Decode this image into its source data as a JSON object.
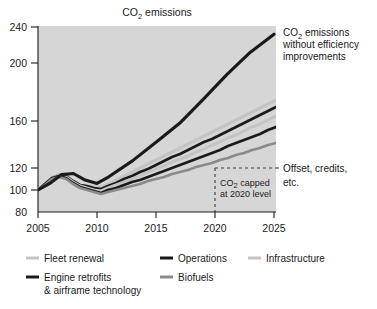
{
  "chart_data": {
    "type": "area",
    "title": "CO2 emissions",
    "title_display": "CO₂ emissions",
    "xlabel": "",
    "ylabel": "",
    "x": [
      2005,
      2010,
      2015,
      2020,
      2025
    ],
    "xlim": [
      2005,
      2025
    ],
    "ylim": [
      80,
      240
    ],
    "ytick_labels": [
      "240",
      "200",
      "160",
      "120",
      "100",
      "80"
    ],
    "ytick_values": [
      240,
      200,
      160,
      120,
      100,
      80
    ],
    "xtick_labels": [
      "2005",
      "2010",
      "2015",
      "2020",
      "2025"
    ],
    "grid": false,
    "legend_position": "bottom",
    "baseline_series": {
      "name": "CO2 emissions without efficiency improvements",
      "color": "#1a1a1a",
      "x": [
        2005,
        2006,
        2007,
        2008,
        2009,
        2010,
        2011,
        2013,
        2015,
        2017,
        2019,
        2021,
        2023,
        2025
      ],
      "values": [
        100,
        106,
        114,
        115,
        109,
        106,
        112,
        126,
        142,
        158,
        175,
        192,
        212,
        232
      ]
    },
    "series": [
      {
        "name": "Fleet renewal",
        "color": "#c4c4c4",
        "values_2025": 157
      },
      {
        "name": "Operations",
        "color": "#1a1a1a",
        "values_2025": 152
      },
      {
        "name": "Infrastructure",
        "color": "#c4c4c4",
        "values_2025": 147
      },
      {
        "name": "Engine retrofits & airframe technology",
        "color": "#1a1a1a",
        "values_2025": 141
      },
      {
        "name": "Biofuels",
        "color": "#8a8a8a",
        "values_2025": 133
      }
    ],
    "wedge_curves": [
      {
        "name": "fleet-renewal-top",
        "color": "#c4c4c4",
        "width": 3.2,
        "points": "38,190 45,184 52,178 59,175 66,176 73,181 80,185 87,186 94,187 101,187 108,184 116,180 124,176 132,172 140,168 148,164 156,160 164,156 172,152 180,148 188,144 196,140 204,136 212,132 220,128 228,124 236,120 244,116 252,112 260,108 268,104 276,100"
      },
      {
        "name": "operations-top",
        "color": "#1a1a1a",
        "width": 2.6,
        "points": "38,190 45,184 52,178 59,175 66,176 73,181 80,185 87,186 94,188 101,189 108,186 116,183 124,179 132,176 140,172 148,169 156,165 164,161 172,157 180,154 188,150 196,146 204,142 212,139 220,135 228,131 236,127 244,123 252,119 260,115 268,111 276,107"
      },
      {
        "name": "infrastructure-top",
        "color": "#c4c4c4",
        "width": 3.0,
        "points": "38,190 45,184 52,178 59,175 66,177 73,182 80,186 87,188 94,190 101,191 108,188 116,185 124,182 132,179 140,176 148,172 156,169 164,166 172,162 180,159 188,156 196,152 204,149 212,145 220,142 228,138 236,135 244,131 252,127 260,124 268,120 276,116"
      },
      {
        "name": "engine-retrofits-top",
        "color": "#1a1a1a",
        "width": 2.6,
        "points": "38,190 45,184 52,178 59,176 66,178 73,183 80,187 87,189 94,191 101,193 108,190 116,188 124,185 132,182 140,180 148,177 156,174 164,171 172,168 180,165 188,162 196,159 204,156 212,153 220,150 228,146 236,143 244,140 252,137 260,134 268,130 276,127"
      },
      {
        "name": "biofuels-top",
        "color": "#8a8a8a",
        "width": 2.6,
        "points": "38,190 45,185 52,179 59,177 66,179 73,184 80,188 87,190 94,192 101,194 108,192 116,190 124,188 132,186 140,184 148,181 156,179 164,177 172,174 180,172 188,170 196,167 204,165 212,163 220,160 228,158 236,155 244,153 252,150 260,148 268,145 276,143"
      }
    ],
    "annotations": [
      {
        "id": "baseline-annotation",
        "lines": [
          "CO₂ emissions",
          "without efficiency",
          "improvements"
        ],
        "x": 283,
        "y": 33
      },
      {
        "id": "offset-annotation",
        "lines": [
          "Offset, credits,",
          "etc."
        ],
        "x": 283,
        "y": 174
      },
      {
        "id": "cap-annotation",
        "lines": [
          "CO₂ capped",
          "at 2020 level"
        ],
        "x": 219,
        "y": 184
      }
    ],
    "cap_lines": {
      "vertical_year": 2020,
      "horizontal_level": 120,
      "style": "dashed",
      "color": "#3a3a3a"
    },
    "plot_bg": "#d6d6d6",
    "axis_color": "#1b1b1b"
  },
  "legend": {
    "items": [
      {
        "label": "Fleet renewal",
        "color": "#c4c4c4"
      },
      {
        "label": "Operations",
        "color": "#1a1a1a"
      },
      {
        "label": "Infrastructure",
        "color": "#c4c4c4"
      },
      {
        "label": "Engine retrofits",
        "label2": "& airframe technology",
        "color": "#1a1a1a"
      },
      {
        "label": "Biofuels",
        "color": "#8a8a8a"
      }
    ]
  }
}
